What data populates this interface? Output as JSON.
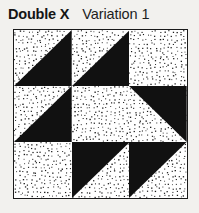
{
  "header": {
    "block_name": "Double X",
    "variation_label": "Variation 1"
  },
  "colors": {
    "dark_fabric": "#111111",
    "light_fabric": "#ffffff",
    "dot_color": "#1a1a1a",
    "border_color": "#1a1a1a",
    "page_background": "#f2f1ee",
    "text_color": "#151515"
  },
  "quilt_block": {
    "name": "Double X Variation 1",
    "grid_rows": 3,
    "grid_cols": 3,
    "unit_type": "half-square-triangle",
    "cells": [
      {
        "position": "top-left",
        "row": 0,
        "col": 0,
        "pattern": "half-square-triangle",
        "dark_corner": "bottom-right"
      },
      {
        "position": "top-center",
        "row": 0,
        "col": 1,
        "pattern": "half-square-triangle",
        "dark_corner": "bottom-right"
      },
      {
        "position": "top-right",
        "row": 0,
        "col": 2,
        "pattern": "solid-light",
        "dark_corner": "none"
      },
      {
        "position": "middle-left",
        "row": 1,
        "col": 0,
        "pattern": "half-square-triangle",
        "dark_corner": "bottom-right"
      },
      {
        "position": "middle-center",
        "row": 1,
        "col": 1,
        "pattern": "solid-light",
        "dark_corner": "none"
      },
      {
        "position": "middle-right",
        "row": 1,
        "col": 2,
        "pattern": "half-square-triangle",
        "dark_corner": "top-right"
      },
      {
        "position": "bottom-left",
        "row": 2,
        "col": 0,
        "pattern": "solid-light",
        "dark_corner": "none"
      },
      {
        "position": "bottom-center",
        "row": 2,
        "col": 1,
        "pattern": "half-square-triangle",
        "dark_corner": "top-left"
      },
      {
        "position": "bottom-right",
        "row": 2,
        "col": 2,
        "pattern": "half-square-triangle",
        "dark_corner": "top-left"
      }
    ]
  }
}
